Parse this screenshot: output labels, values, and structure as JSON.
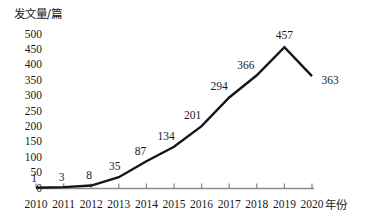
{
  "chart_data": {
    "type": "line",
    "title": "",
    "xlabel": "年份",
    "ylabel": "发文量/篇",
    "categories": [
      "2010",
      "2011",
      "2012",
      "2013",
      "2014",
      "2015",
      "2016",
      "2017",
      "2018",
      "2019",
      "2020"
    ],
    "values": [
      1,
      3,
      8,
      35,
      87,
      134,
      201,
      294,
      366,
      457,
      363
    ],
    "point_labels": [
      "1",
      "3",
      "8",
      "35",
      "87",
      "134",
      "201",
      "294",
      "366",
      "457",
      "363"
    ],
    "ylim": [
      0,
      500
    ],
    "ytick_labels": [
      "500",
      "450",
      "400",
      "350",
      "300",
      "250",
      "200",
      "150",
      "100",
      "50",
      "0"
    ],
    "ytick_values": [
      500,
      450,
      400,
      350,
      300,
      250,
      200,
      150,
      100,
      50,
      0
    ],
    "grid": false,
    "legend": null,
    "series": [
      {
        "name": "发文量/篇",
        "values": [
          1,
          3,
          8,
          35,
          87,
          134,
          201,
          294,
          366,
          457,
          363
        ],
        "color": "#151515"
      }
    ],
    "line_color": "#151515",
    "axis_color": "#8a8a8a",
    "text_color": "#1a1a1a"
  }
}
